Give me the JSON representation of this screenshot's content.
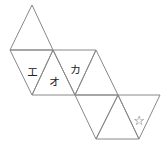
{
  "diagram": {
    "title": "",
    "line_color": "#888888",
    "labels": {
      "e": "エ",
      "o": "オ",
      "ka": "カ",
      "star": "☆"
    }
  }
}
